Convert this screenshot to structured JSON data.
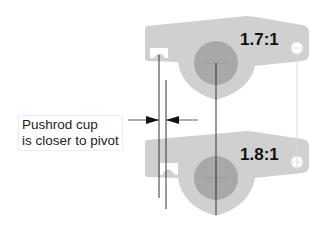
{
  "diagram": {
    "rockers": [
      {
        "id": "top",
        "ratio_label": "1.7:1"
      },
      {
        "id": "bottom",
        "ratio_label": "1.8:1"
      }
    ],
    "callout": {
      "line1": "Pushrod cup",
      "line2": "is closer to pivot"
    },
    "colors": {
      "body": "#d0d0d0",
      "pivot": "#a8a8a8",
      "line": "#333333",
      "text": "#111111"
    }
  }
}
